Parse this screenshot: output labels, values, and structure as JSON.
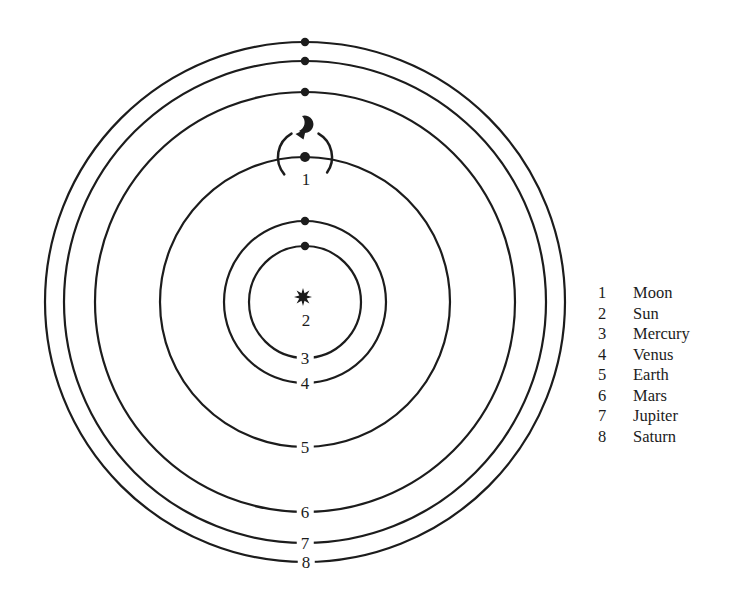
{
  "page": {
    "colors": {
      "ink": "#1c1c1c",
      "background": "#ffffff"
    }
  },
  "diagram": {
    "type": "heliocentric-orbit-diagram",
    "sun_label": "2",
    "moon_label": "1",
    "orbit_labels": {
      "mercury": "3",
      "venus": "4",
      "earth": "5",
      "mars": "6",
      "jupiter": "7",
      "saturn": "8"
    },
    "icons": {
      "sun": "sun-star-icon (8-pointed black star)",
      "moon_direction": "crescent-arrow-icon (crescent with counterclockwise arrow)",
      "planet": "filled-dot"
    }
  },
  "legend": {
    "items": [
      {
        "number": "1",
        "name": "Moon"
      },
      {
        "number": "2",
        "name": "Sun"
      },
      {
        "number": "3",
        "name": "Mercury"
      },
      {
        "number": "4",
        "name": "Venus"
      },
      {
        "number": "5",
        "name": "Earth"
      },
      {
        "number": "6",
        "name": "Mars"
      },
      {
        "number": "7",
        "name": "Jupiter"
      },
      {
        "number": "8",
        "name": "Saturn"
      }
    ]
  }
}
